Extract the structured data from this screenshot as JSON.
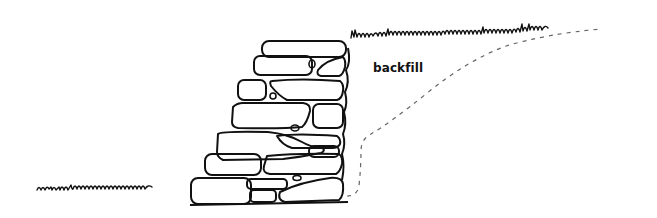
{
  "diagram": {
    "labels": {
      "backfill": "backfill"
    },
    "colors": {
      "background": "#ffffff",
      "ink": "#111111",
      "dashed_line": "#666666"
    },
    "elements": [
      "stone wall (7 courses, battered face)",
      "backfill boundary (dashed curve)",
      "upper ground grass line",
      "lower ground grass line"
    ]
  }
}
